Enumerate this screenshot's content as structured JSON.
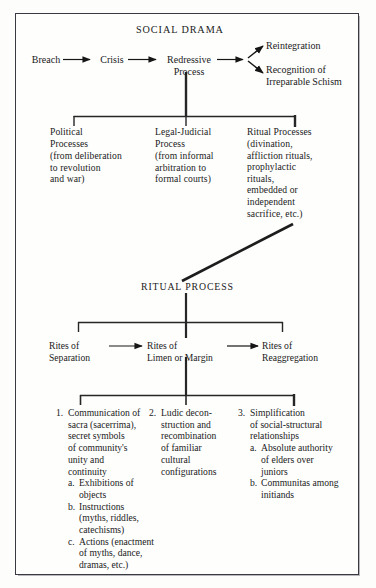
{
  "figure": {
    "title": "SOCIAL DRAMA",
    "secondary_title": "RITUAL PROCESS",
    "border_color": "#3a3a42",
    "text_color": "#1a1a1a",
    "background": "#fefefd"
  },
  "social_drama": {
    "sequence": [
      {
        "label": "Breach"
      },
      {
        "label": "Crisis"
      },
      {
        "label": "Redressive\nProcess"
      }
    ],
    "outcomes": [
      {
        "label": "Reintegration"
      },
      {
        "label": "Recognition of\nIrreparable Schism"
      }
    ]
  },
  "redressive_branches": [
    {
      "heading": "Political\nProcesses",
      "detail": "(from deliberation\nto revolution\nand war)"
    },
    {
      "heading": "Legal-Judicial\nProcess",
      "detail": "(from informal\narbitration to\nformal courts)"
    },
    {
      "heading": "Ritual Processes",
      "detail": "(divination,\naffliction rituals,\nprophylactic\nrituals,\nembedded or\nindependent\nsacrifice, etc.)"
    }
  ],
  "ritual_process": {
    "title": "RITUAL PROCESS",
    "rites": [
      {
        "label": "Rites of\nSeparation"
      },
      {
        "label": "Rites of\nLimen or Margin"
      },
      {
        "label": "Rites of\nReaggregation"
      }
    ]
  },
  "liminal_features": [
    {
      "number": "1.",
      "text": "Communication of\nsacra (sacerrima),\nsecret symbols\nof community's\nunity and\ncontinuity",
      "subitems": [
        {
          "marker": "a.",
          "text": "Exhibitions of\nobjects"
        },
        {
          "marker": "b.",
          "text": "Instructions\n(myths, riddles,\ncatechisms)"
        },
        {
          "marker": "c.",
          "text": "Actions (enactment\nof myths, dance,\ndramas, etc.)"
        }
      ]
    },
    {
      "number": "2.",
      "text": "Ludic decon-\nstruction and\nrecombination\nof familiar\ncultural\nconfigurations",
      "subitems": []
    },
    {
      "number": "3.",
      "text": "Simplification\nof social-structural\nrelationships",
      "subitems": [
        {
          "marker": "a.",
          "text": "Absolute authority\nof elders over\njuniors"
        },
        {
          "marker": "b.",
          "text": "Communitas among\ninitiands"
        }
      ]
    }
  ],
  "connectors": {
    "arrow_breach_to_crisis": "arrow-right",
    "arrow_crisis_to_redressive": "arrow-right",
    "arrow_redressive_to_fork": "arrow-right-fork",
    "arrow_separation_to_limen": "arrow-right",
    "arrow_limen_to_reaggregation": "arrow-right",
    "diagonal_ritual_link": "diagonal-line",
    "trunk_redressive": "vertical-trunk",
    "trunk_ritual_process": "vertical-trunk",
    "trunk_limen": "vertical-trunk"
  }
}
